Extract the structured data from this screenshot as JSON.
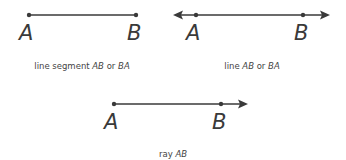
{
  "figures": [
    {
      "kind": "line-segment",
      "point_labels": [
        "A",
        "B"
      ],
      "caption_prefix": "line segment ",
      "caption_italic_1": "AB",
      "caption_mid": " or ",
      "caption_italic_2": "BA"
    },
    {
      "kind": "line",
      "point_labels": [
        "A",
        "B"
      ],
      "caption_prefix": "line ",
      "caption_italic_1": "AB",
      "caption_mid": " or ",
      "caption_italic_2": "BA"
    },
    {
      "kind": "ray",
      "point_labels": [
        "A",
        "B"
      ],
      "caption_prefix": "ray ",
      "caption_italic_1": "AB"
    }
  ],
  "colors": {
    "stroke": "#3a3a3a",
    "text": "#444444"
  }
}
